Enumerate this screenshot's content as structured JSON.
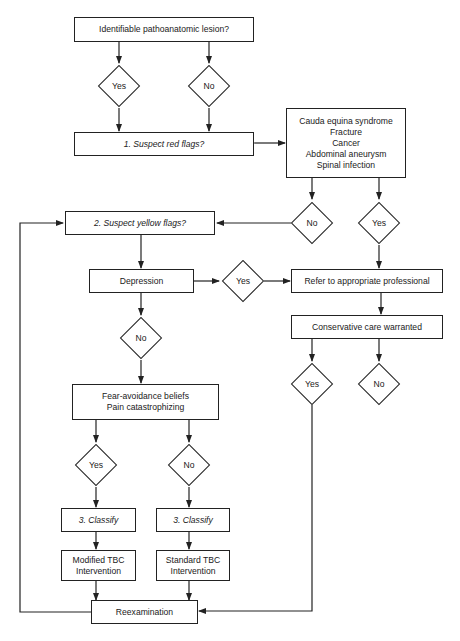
{
  "diagram": {
    "nodes": {
      "lesion": "Identifiable pathoanatomic lesion?",
      "lesion_yes": "Yes",
      "lesion_no": "No",
      "red_flags": "1. Suspect red flags?",
      "red_list": [
        "Cauda equina syndrome",
        "Fracture",
        "Cancer",
        "Abdominal aneurysm",
        "Spinal infection"
      ],
      "red_no": "No",
      "red_yes": "Yes",
      "yellow_flags": "2. Suspect yellow flags?",
      "depression": "Depression",
      "depression_yes": "Yes",
      "depression_no": "No",
      "refer": "Refer to appropriate professional",
      "conservative": "Conservative care warranted",
      "conservative_yes": "Yes",
      "conservative_no": "No",
      "fear": [
        "Fear-avoidance beliefs",
        "Pain catastrophizing"
      ],
      "fear_yes": "Yes",
      "fear_no": "No",
      "classify_left": "3. Classify",
      "classify_right": "3. Classify",
      "modified": [
        "Modified TBC",
        "Intervention"
      ],
      "standard": [
        "Standard TBC",
        "Intervention"
      ],
      "reexam": "Reexamination"
    },
    "colors": {
      "line": "#222222",
      "background": "#ffffff"
    }
  }
}
